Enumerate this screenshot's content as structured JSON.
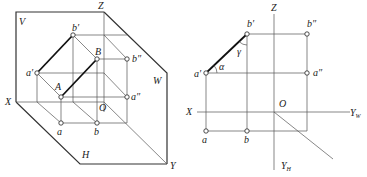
{
  "left_figure": {
    "planes": {
      "V": "V",
      "W": "W",
      "H": "H"
    },
    "axes": {
      "X": "X",
      "Y": "Y",
      "Z": "Z",
      "O": "O"
    },
    "points": {
      "a_prime": "a′",
      "b_prime": "b′",
      "A": "A",
      "B": "B",
      "a_dprime": "a″",
      "b_dprime": "b″",
      "a": "a",
      "b": "b"
    }
  },
  "right_figure": {
    "axes": {
      "Z": "Z",
      "X": "X",
      "O": "O",
      "YW": "Y",
      "YW_sub": "W",
      "YH": "Y",
      "YH_sub": "H"
    },
    "points": {
      "a_prime": "a′",
      "b_prime": "b′",
      "a_dprime": "a″",
      "b_dprime": "b″",
      "a": "a",
      "b": "b"
    },
    "angles": {
      "alpha": "α",
      "gamma": "γ"
    }
  }
}
